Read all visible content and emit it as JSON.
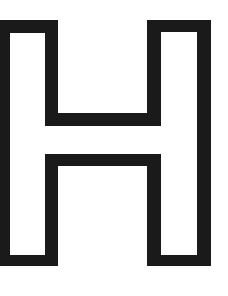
{
  "glyph": {
    "letter": "H",
    "style": "outline",
    "stroke_color": "#1a1a1a",
    "fill_color": "#ffffff"
  }
}
